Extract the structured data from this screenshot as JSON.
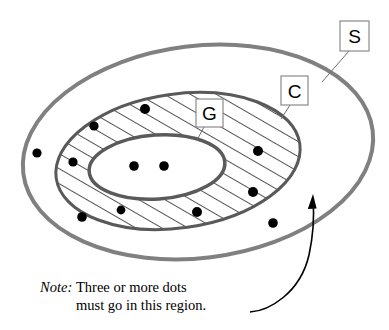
{
  "figure": {
    "type": "venn-diagram",
    "title": "",
    "background_color": "#ffffff",
    "regions": [
      {
        "id": "S",
        "label": "S",
        "role": "outermost-set",
        "fill": "#ffffff",
        "stroke": "#808080",
        "stroke_width": 4,
        "cx": 198,
        "cy": 152,
        "rx": 176,
        "ry": 106,
        "rotation": -7,
        "hatched": false
      },
      {
        "id": "C",
        "label": "C",
        "role": "middle-set",
        "fill": "#ffffff",
        "stroke": "#595959",
        "stroke_width": 3,
        "cx": 178,
        "cy": 161,
        "rx": 123,
        "ry": 67,
        "rotation": -8,
        "hatched": true
      },
      {
        "id": "G",
        "label": "G",
        "role": "innermost-set",
        "fill": "#ffffff",
        "stroke": "#5a5a5a",
        "stroke_width": 3.5,
        "cx": 157,
        "cy": 167,
        "rx": 68,
        "ry": 32,
        "rotation": -4,
        "hatched": false
      }
    ],
    "labels": [
      {
        "id": "label-S",
        "text": "S",
        "box_x": 340,
        "box_y": 21,
        "box_w": 29,
        "box_h": 30,
        "leader_x1": 349,
        "leader_y1": 51,
        "leader_x2": 322,
        "leader_y2": 82
      },
      {
        "id": "label-C",
        "text": "C",
        "box_x": 281,
        "box_y": 76,
        "box_w": 27,
        "box_h": 29,
        "leader_x1": 290,
        "leader_y1": 105,
        "leader_x2": 281,
        "leader_y2": 119
      },
      {
        "id": "label-G",
        "text": "G",
        "box_x": 196,
        "box_y": 99,
        "box_w": 27,
        "box_h": 28,
        "leader_x1": 204,
        "leader_y1": 127,
        "leader_x2": 197,
        "leader_y2": 140
      }
    ],
    "dots": [
      {
        "id": "dot-1",
        "x": 37,
        "y": 153,
        "r": 4.6,
        "region": "S-only"
      },
      {
        "id": "dot-2",
        "x": 73,
        "y": 162,
        "r": 4.6,
        "region": "C-not-G"
      },
      {
        "id": "dot-3",
        "x": 94,
        "y": 126,
        "r": 4.6,
        "region": "C-not-G"
      },
      {
        "id": "dot-4",
        "x": 145,
        "y": 109,
        "r": 5.0,
        "region": "C-not-G"
      },
      {
        "id": "dot-5",
        "x": 82,
        "y": 217,
        "r": 4.8,
        "region": "C-not-G"
      },
      {
        "id": "dot-6",
        "x": 121,
        "y": 210,
        "r": 4.4,
        "region": "C-not-G"
      },
      {
        "id": "dot-7",
        "x": 197,
        "y": 212,
        "r": 5.0,
        "region": "C-not-G"
      },
      {
        "id": "dot-8",
        "x": 258,
        "y": 151,
        "r": 5.0,
        "region": "C-not-G"
      },
      {
        "id": "dot-9",
        "x": 253,
        "y": 192,
        "r": 5.0,
        "region": "C-not-G"
      },
      {
        "id": "dot-10",
        "x": 273,
        "y": 223,
        "r": 4.8,
        "region": "S-only"
      },
      {
        "id": "dot-11",
        "x": 134,
        "y": 166,
        "r": 4.8,
        "region": "G"
      },
      {
        "id": "dot-12",
        "x": 164,
        "y": 166,
        "r": 4.8,
        "region": "G"
      }
    ],
    "annotation_arrow": {
      "id": "callout-arrow",
      "path": "M 250 312 C 268 311, 300 294, 309 255 C 314 232, 314 212, 313 199",
      "tip_x": 313,
      "tip_y": 194,
      "stroke": "#000000",
      "stroke_width": 1.6
    }
  },
  "note": {
    "keyword": "Note:",
    "line1": "Three or more dots",
    "line2": "must go in this region."
  },
  "colors": {
    "outer_stroke": "#808080",
    "middle_stroke": "#595959",
    "inner_stroke": "#5a5a5a",
    "dot_fill": "#000000",
    "hatch_stroke": "#1a1a1a",
    "label_box_stroke": "#8a8a8a",
    "text": "#000000"
  }
}
